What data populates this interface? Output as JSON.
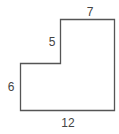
{
  "diagram": {
    "type": "composite-rectilinear-figure",
    "stroke_color": "#555555",
    "label_color": "#444444",
    "labels": {
      "top": "7",
      "inner_vertical": "5",
      "left": "6",
      "bottom": "12"
    },
    "side_lengths": {
      "top": 7,
      "inner_vertical": 5,
      "left": 6,
      "bottom": 12
    }
  }
}
